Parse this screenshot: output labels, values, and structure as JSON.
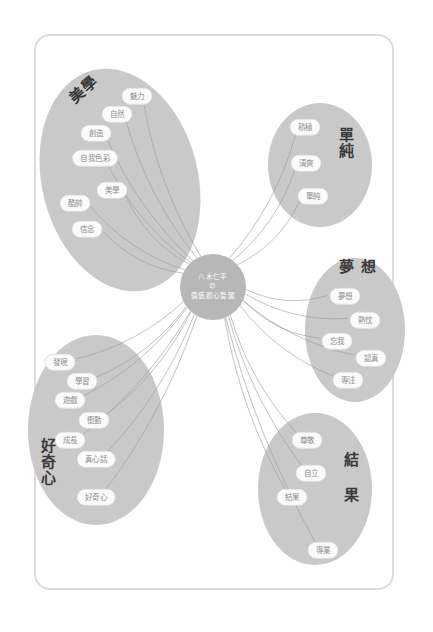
{
  "canvas": {
    "width": 433,
    "height": 632,
    "background": "#ffffff",
    "frame_color": "#dcdcdc",
    "cluster_fill": "#c9c9c9",
    "center_fill": "#b7b7b7",
    "pill_fill": "#fbfbfb",
    "pill_text_color": "#8c8c8c",
    "connector_color": "#9a9a9a"
  },
  "center": {
    "label_line1": "八木仁平",
    "label_line2": "の",
    "label_line3": "價值觀心智圖",
    "cx": 213,
    "cy": 287,
    "r": 33
  },
  "clusters": [
    {
      "id": "aesthetics",
      "title": "美學",
      "title_x": 84,
      "title_y": 90,
      "title_rotate": -42,
      "vertical": false,
      "ellipse": {
        "cx": 120,
        "cy": 180,
        "rx": 78,
        "ry": 113,
        "rotate": -14
      },
      "leaves": [
        {
          "label": "魅力",
          "x": 137,
          "y": 96
        },
        {
          "label": "自然",
          "x": 117,
          "y": 114
        },
        {
          "label": "創造",
          "x": 96,
          "y": 133
        },
        {
          "label": "自我色彩",
          "x": 95,
          "y": 158
        },
        {
          "label": "美學",
          "x": 112,
          "y": 190
        },
        {
          "label": "酷帥",
          "x": 75,
          "y": 203
        },
        {
          "label": "信念",
          "x": 87,
          "y": 229
        }
      ]
    },
    {
      "id": "simplicity",
      "title": "單純",
      "title_x": 345,
      "title_y": 143,
      "title_rotate": 0,
      "vertical": true,
      "ellipse": {
        "cx": 320,
        "cy": 165,
        "rx": 52,
        "ry": 62,
        "rotate": 0
      },
      "leaves": [
        {
          "label": "積極",
          "x": 305,
          "y": 127
        },
        {
          "label": "清爽",
          "x": 306,
          "y": 163
        },
        {
          "label": "單純",
          "x": 313,
          "y": 196
        }
      ]
    },
    {
      "id": "dream",
      "title": "夢 想",
      "title_x": 358,
      "title_y": 268,
      "title_rotate": 0,
      "vertical": false,
      "ellipse": {
        "cx": 355,
        "cy": 330,
        "rx": 50,
        "ry": 72,
        "rotate": 0
      },
      "leaves": [
        {
          "label": "夢想",
          "x": 345,
          "y": 296
        },
        {
          "label": "熱忱",
          "x": 365,
          "y": 320
        },
        {
          "label": "忘我",
          "x": 337,
          "y": 341
        },
        {
          "label": "認真",
          "x": 371,
          "y": 358
        },
        {
          "label": "專注",
          "x": 348,
          "y": 380
        }
      ]
    },
    {
      "id": "curiosity",
      "title": "好奇心",
      "title_x": 47,
      "title_y": 462,
      "title_rotate": 0,
      "vertical": true,
      "ellipse": {
        "cx": 96,
        "cy": 430,
        "rx": 68,
        "ry": 95,
        "rotate": 0
      },
      "leaves": [
        {
          "label": "發現",
          "x": 60,
          "y": 362
        },
        {
          "label": "學習",
          "x": 82,
          "y": 381
        },
        {
          "label": "遊戲",
          "x": 70,
          "y": 400
        },
        {
          "label": "衝動",
          "x": 94,
          "y": 420
        },
        {
          "label": "成長",
          "x": 70,
          "y": 440
        },
        {
          "label": "真心話",
          "x": 96,
          "y": 459
        },
        {
          "label": "好奇心",
          "x": 96,
          "y": 497
        }
      ]
    },
    {
      "id": "result",
      "title": "結 果",
      "title_x": 350,
      "title_y": 477,
      "title_rotate": 0,
      "vertical": true,
      "ellipse": {
        "cx": 315,
        "cy": 489,
        "rx": 57,
        "ry": 76,
        "rotate": 0
      },
      "leaves": [
        {
          "label": "尊敬",
          "x": 307,
          "y": 440
        },
        {
          "label": "自立",
          "x": 311,
          "y": 473
        },
        {
          "label": "結果",
          "x": 292,
          "y": 497
        },
        {
          "label": "專業",
          "x": 323,
          "y": 550
        }
      ]
    }
  ]
}
